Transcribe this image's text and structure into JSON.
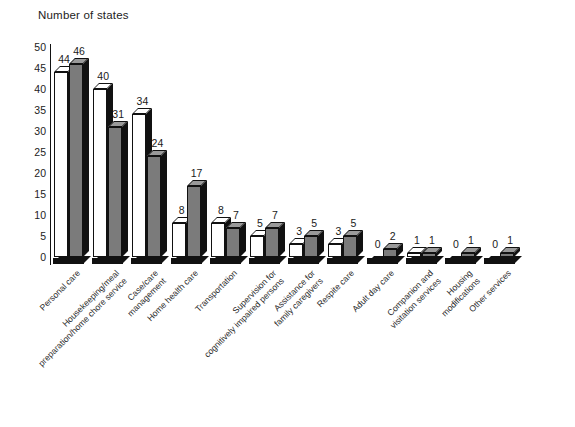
{
  "chart_data": {
    "type": "bar",
    "title": "Number of states",
    "xlabel": "",
    "ylabel": "Number of states",
    "ylim": [
      0,
      50
    ],
    "yticks": [
      0,
      5,
      10,
      15,
      20,
      25,
      30,
      35,
      40,
      45,
      50
    ],
    "grid": false,
    "legend": "none",
    "orientation": "vertical",
    "grouped": true,
    "categories": [
      "Personal care",
      "Housekeeping/meal preparation/home chore service",
      "Case/care management",
      "Home health care",
      "Transportation",
      "Supervision for cognitively impaired persons",
      "Assistance for family caregivers",
      "Respite care",
      "Adult day care",
      "Companion and visitation services",
      "Housing modifications",
      "Other services"
    ],
    "category_lines": [
      [
        "Personal care"
      ],
      [
        "Housekeeping/meal",
        "preparation/home chore service"
      ],
      [
        "Case/care",
        "management"
      ],
      [
        "Home health care"
      ],
      [
        "Transportation"
      ],
      [
        "Supervision for",
        "cognitively impaired persons"
      ],
      [
        "Assistance for",
        "family caregivers"
      ],
      [
        "Respite care"
      ],
      [
        "Adult day care"
      ],
      [
        "Companion and",
        "visitation services"
      ],
      [
        "Housing",
        "modifications"
      ],
      [
        "Other services"
      ]
    ],
    "series": [
      {
        "name": "series-1",
        "color": "#ffffff",
        "values": [
          44,
          40,
          34,
          8,
          8,
          5,
          3,
          3,
          0,
          1,
          0,
          0
        ]
      },
      {
        "name": "series-2",
        "color": "#7b7b7b",
        "values": [
          46,
          31,
          24,
          17,
          7,
          7,
          5,
          5,
          2,
          1,
          1,
          1
        ]
      }
    ]
  },
  "axis": {
    "y_tick_labels": [
      "50",
      "45",
      "40",
      "35",
      "30",
      "25",
      "20",
      "15",
      "10",
      "5",
      "0"
    ]
  }
}
